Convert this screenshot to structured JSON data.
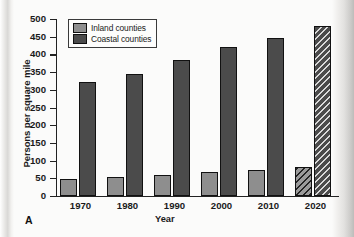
{
  "figure": {
    "panel_label": "A"
  },
  "chart_data": {
    "type": "bar",
    "title": "",
    "xlabel": "Year",
    "ylabel": "Persons per square mile",
    "categories": [
      "1970",
      "1980",
      "1990",
      "2000",
      "2010",
      "2020"
    ],
    "series": [
      {
        "name": "Inland counties",
        "color": "#8e8e8e",
        "values": [
          48,
          53,
          58,
          67,
          74,
          82
        ]
      },
      {
        "name": "Coastal counties",
        "color": "#4b4b4b",
        "values": [
          321,
          344,
          383,
          420,
          447,
          479
        ]
      }
    ],
    "projected_categories": [
      "2020"
    ],
    "projected_note": "2020 bars drawn with diagonal hatch pattern (projected values)",
    "ylim": [
      0,
      500
    ],
    "yticks": [
      0,
      50,
      100,
      150,
      200,
      250,
      300,
      350,
      400,
      450,
      500
    ],
    "ytick_labels": [
      "0",
      "50",
      "100",
      "150",
      "200",
      "250",
      "300",
      "350",
      "400",
      "450",
      "500"
    ],
    "grid": false,
    "legend_position": "top-left",
    "legend_entries": [
      "Inland counties",
      "Coastal counties"
    ]
  }
}
